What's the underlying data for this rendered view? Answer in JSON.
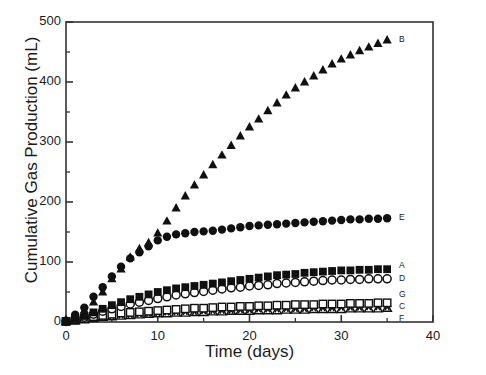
{
  "chart_data": {
    "type": "scatter",
    "title": "",
    "xlabel": "Time (days)",
    "ylabel": "Cumulative Gas Production (mL)",
    "xlim": [
      0,
      40
    ],
    "ylim": [
      0,
      500
    ],
    "xticks": [
      0,
      10,
      20,
      30,
      40
    ],
    "xtick_labels": [
      "0",
      "10",
      "20",
      "30",
      "40"
    ],
    "yticks": [
      0,
      100,
      200,
      300,
      400,
      500
    ],
    "ytick_labels": [
      "0",
      "100",
      "200",
      "300",
      "400",
      "500"
    ],
    "x_minor_step": 5,
    "y_minor_step": 50,
    "grid": false,
    "legend_position": "right-inline",
    "series": [
      {
        "name": "B",
        "label": "B",
        "marker": "filled-triangle",
        "color": "#101010",
        "x": [
          0,
          1,
          2,
          3,
          4,
          5,
          6,
          7,
          8,
          9,
          10,
          11,
          12,
          13,
          14,
          15,
          16,
          17,
          18,
          19,
          20,
          21,
          22,
          23,
          24,
          25,
          26,
          27,
          28,
          29,
          30,
          31,
          32,
          33,
          34,
          35
        ],
        "y": [
          2,
          10,
          20,
          33,
          50,
          72,
          88,
          108,
          122,
          132,
          148,
          168,
          190,
          210,
          228,
          245,
          262,
          278,
          294,
          310,
          325,
          338,
          352,
          365,
          378,
          390,
          400,
          410,
          420,
          430,
          438,
          445,
          452,
          458,
          464,
          470
        ]
      },
      {
        "name": "E",
        "label": "E",
        "marker": "filled-circle",
        "color": "#101010",
        "x": [
          0,
          1,
          2,
          3,
          4,
          5,
          6,
          7,
          8,
          9,
          10,
          11,
          12,
          13,
          14,
          15,
          16,
          17,
          18,
          19,
          20,
          21,
          22,
          23,
          24,
          25,
          26,
          27,
          28,
          29,
          30,
          31,
          32,
          33,
          34,
          35
        ],
        "y": [
          2,
          12,
          24,
          42,
          58,
          76,
          92,
          106,
          116,
          126,
          136,
          142,
          146,
          148,
          150,
          151,
          152,
          154,
          156,
          158,
          160,
          161,
          162,
          163,
          164,
          165,
          166,
          167,
          168,
          169,
          170,
          171,
          171,
          172,
          172,
          173
        ]
      },
      {
        "name": "A",
        "label": "A",
        "marker": "filled-square",
        "color": "#101010",
        "x": [
          0,
          1,
          2,
          3,
          4,
          5,
          6,
          7,
          8,
          9,
          10,
          11,
          12,
          13,
          14,
          15,
          16,
          17,
          18,
          19,
          20,
          21,
          22,
          23,
          24,
          25,
          26,
          27,
          28,
          29,
          30,
          31,
          32,
          33,
          34,
          35
        ],
        "y": [
          1,
          5,
          10,
          16,
          22,
          28,
          33,
          38,
          42,
          46,
          50,
          53,
          56,
          58,
          60,
          62,
          64,
          66,
          68,
          70,
          72,
          74,
          76,
          78,
          79,
          80,
          82,
          83,
          84,
          85,
          86,
          86,
          87,
          87,
          88,
          88
        ]
      },
      {
        "name": "D",
        "label": "D",
        "marker": "open-circle",
        "color": "#101010",
        "x": [
          0,
          1,
          2,
          3,
          4,
          5,
          6,
          7,
          8,
          9,
          10,
          11,
          12,
          13,
          14,
          15,
          16,
          17,
          18,
          19,
          20,
          21,
          22,
          23,
          24,
          25,
          26,
          27,
          28,
          29,
          30,
          31,
          32,
          33,
          34,
          35
        ],
        "y": [
          1,
          4,
          8,
          13,
          18,
          22,
          26,
          30,
          33,
          36,
          39,
          42,
          45,
          47,
          49,
          51,
          53,
          55,
          57,
          58,
          60,
          61,
          62,
          64,
          65,
          66,
          67,
          68,
          69,
          70,
          70,
          71,
          71,
          72,
          72,
          72
        ]
      },
      {
        "name": "G",
        "label": "G",
        "marker": "open-square",
        "color": "#101010",
        "x": [
          0,
          1,
          2,
          3,
          4,
          5,
          6,
          7,
          8,
          9,
          10,
          11,
          12,
          13,
          14,
          15,
          16,
          17,
          18,
          19,
          20,
          21,
          22,
          23,
          24,
          25,
          26,
          27,
          28,
          29,
          30,
          31,
          32,
          33,
          34,
          35
        ],
        "y": [
          1,
          3,
          6,
          9,
          11,
          13,
          15,
          16,
          17,
          18,
          19,
          20,
          21,
          22,
          23,
          23,
          24,
          25,
          25,
          26,
          26,
          27,
          27,
          28,
          28,
          29,
          29,
          29,
          30,
          30,
          30,
          31,
          31,
          31,
          32,
          32
        ]
      },
      {
        "name": "C",
        "label": "C",
        "marker": "asterisk",
        "color": "#101010",
        "x": [
          0,
          1,
          2,
          3,
          4,
          5,
          6,
          7,
          8,
          9,
          10,
          11,
          12,
          13,
          14,
          15,
          16,
          17,
          18,
          19,
          20,
          21,
          22,
          23,
          24,
          25,
          26,
          27,
          28,
          29,
          30,
          31,
          32,
          33,
          34,
          35
        ],
        "y": [
          1,
          3,
          5,
          7,
          9,
          11,
          12,
          13,
          14,
          15,
          16,
          17,
          17,
          18,
          18,
          19,
          19,
          20,
          20,
          21,
          21,
          22,
          22,
          22,
          23,
          23,
          23,
          24,
          24,
          24,
          25,
          25,
          25,
          26,
          26,
          26
        ]
      },
      {
        "name": "F",
        "label": "F",
        "marker": "open-triangle",
        "color": "#101010",
        "x": [
          0,
          1,
          2,
          3,
          4,
          5,
          6,
          7,
          8,
          9,
          10,
          11,
          12,
          13,
          14,
          15,
          16,
          17,
          18,
          19,
          20,
          21,
          22,
          23,
          24,
          25,
          26,
          27,
          28,
          29,
          30,
          31,
          32,
          33,
          34,
          35
        ],
        "y": [
          1,
          2,
          4,
          6,
          8,
          9,
          10,
          11,
          12,
          13,
          14,
          14,
          15,
          15,
          16,
          16,
          17,
          17,
          18,
          18,
          18,
          19,
          19,
          19,
          20,
          20,
          20,
          21,
          21,
          21,
          21,
          22,
          22,
          22,
          22,
          23
        ]
      }
    ],
    "label_anchors": [
      {
        "name": "B",
        "x": 36.3,
        "y": 470
      },
      {
        "name": "E",
        "x": 36.3,
        "y": 173
      },
      {
        "name": "A",
        "x": 36.3,
        "y": 93
      },
      {
        "name": "D",
        "x": 36.3,
        "y": 72
      },
      {
        "name": "G",
        "x": 36.3,
        "y": 45
      },
      {
        "name": "C",
        "x": 36.3,
        "y": 25
      },
      {
        "name": "F",
        "x": 36.3,
        "y": 5
      }
    ]
  },
  "axes": {
    "frame_color": "#333333"
  }
}
